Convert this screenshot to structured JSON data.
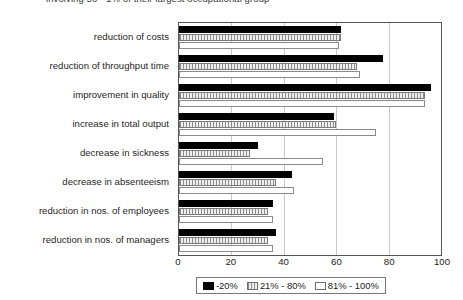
{
  "caption": "involving 50 - 1% of their largest occupational group",
  "legend": {
    "position": "bottom",
    "items": [
      {
        "label": "-20%",
        "swatch": "black-square-icon",
        "color": "#000000"
      },
      {
        "label": "21% - 80%",
        "swatch": "hatched-square-icon",
        "color": "#d4d4d4"
      },
      {
        "label": "81% - 100%",
        "swatch": "white-square-icon",
        "color": "#ffffff"
      }
    ]
  },
  "chart_data": {
    "type": "bar",
    "orientation": "horizontal",
    "title": "",
    "subtitle": "",
    "xlabel": "",
    "ylabel": "",
    "xlim": [
      0,
      100
    ],
    "xticks": [
      0,
      20,
      40,
      60,
      80,
      100
    ],
    "grid": true,
    "categories": [
      "reduction of costs",
      "reduction of throughput time",
      "improvement in quality",
      "increase in total output",
      "decrease in sickness",
      "decrease in absenteeism",
      "reduction in nos. of employees",
      "reduction in nos. of managers"
    ],
    "series": [
      {
        "name": "-20%",
        "values": [
          62,
          78,
          96,
          59,
          30,
          43,
          36,
          37
        ]
      },
      {
        "name": "21% - 80%",
        "values": [
          62,
          68,
          94,
          60,
          27,
          37,
          34,
          34
        ]
      },
      {
        "name": "81% - 100%",
        "values": [
          61,
          69,
          94,
          75,
          55,
          44,
          36,
          36
        ]
      }
    ]
  }
}
